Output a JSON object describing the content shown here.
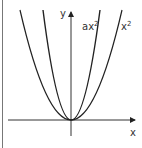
{
  "diagram": {
    "axes": {
      "x_label": "x",
      "y_label": "y"
    },
    "curves": [
      {
        "name": "x-squared",
        "label_base": "x",
        "label_exp": "2",
        "coefficient": 1
      },
      {
        "name": "a-x-squared",
        "label_base": "ax",
        "label_exp": "2",
        "coefficient": "a"
      }
    ],
    "colors": {
      "curve": "#222222",
      "axis": "#333333",
      "border": "#555555",
      "background": "#ffffff"
    }
  }
}
